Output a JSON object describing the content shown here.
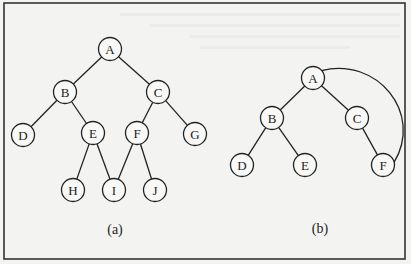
{
  "figure": {
    "width": 411,
    "height": 264,
    "colors": {
      "background": "#f3f3f1",
      "stroke": "#222222",
      "node_fill": "#f8f8f6"
    }
  },
  "trees": [
    {
      "id": "a",
      "caption": "(a)",
      "caption_pos": [
        115,
        229
      ],
      "nodes": [
        {
          "label": "A",
          "x": 110,
          "y": 49
        },
        {
          "label": "B",
          "x": 65,
          "y": 92
        },
        {
          "label": "C",
          "x": 158,
          "y": 92
        },
        {
          "label": "D",
          "x": 23,
          "y": 135
        },
        {
          "label": "E",
          "x": 93,
          "y": 133
        },
        {
          "label": "F",
          "x": 137,
          "y": 133
        },
        {
          "label": "G",
          "x": 195,
          "y": 134
        },
        {
          "label": "H",
          "x": 73,
          "y": 190
        },
        {
          "label": "I",
          "x": 114,
          "y": 190
        },
        {
          "label": "J",
          "x": 155,
          "y": 190
        }
      ],
      "edges": [
        [
          "A",
          "B"
        ],
        [
          "A",
          "C"
        ],
        [
          "B",
          "D"
        ],
        [
          "B",
          "E"
        ],
        [
          "C",
          "F"
        ],
        [
          "C",
          "G"
        ],
        [
          "E",
          "H"
        ],
        [
          "E",
          "I"
        ],
        [
          "F",
          "I"
        ],
        [
          "F",
          "J"
        ]
      ],
      "arcs": []
    },
    {
      "id": "b",
      "caption": "(b)",
      "caption_pos": [
        320,
        228
      ],
      "nodes": [
        {
          "label": "A",
          "x": 313,
          "y": 78
        },
        {
          "label": "B",
          "x": 272,
          "y": 118
        },
        {
          "label": "C",
          "x": 357,
          "y": 118
        },
        {
          "label": "D",
          "x": 242,
          "y": 165
        },
        {
          "label": "E",
          "x": 305,
          "y": 165
        },
        {
          "label": "F",
          "x": 383,
          "y": 165
        }
      ],
      "edges": [
        [
          "A",
          "B"
        ],
        [
          "A",
          "C"
        ],
        [
          "B",
          "D"
        ],
        [
          "B",
          "E"
        ],
        [
          "C",
          "F"
        ]
      ],
      "arcs": [
        [
          "A",
          "F"
        ]
      ]
    }
  ],
  "node_radius": 11.5
}
